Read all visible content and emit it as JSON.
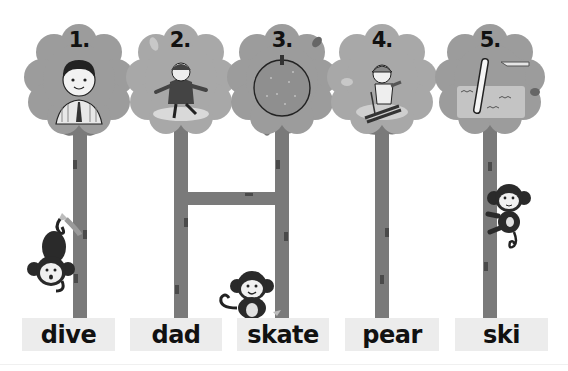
{
  "colors": {
    "crown": "#9c9c9c",
    "trunk": "#7a7a7a",
    "bark_mark": "#4a4a4a",
    "label_bg": "#ececec",
    "text": "#111111"
  },
  "trees": [
    {
      "number": "1.",
      "picture": "man-in-striped-shirt-and-tie",
      "label": "dive"
    },
    {
      "number": "2.",
      "picture": "girl-ice-skating",
      "label": "dad"
    },
    {
      "number": "3.",
      "picture": "pear-fruit",
      "label": "skate"
    },
    {
      "number": "4.",
      "picture": "boy-skiing",
      "label": "pear"
    },
    {
      "number": "5.",
      "picture": "person-diving-into-pool",
      "label": "ski"
    }
  ],
  "ladder_connection": {
    "from_tree": 2,
    "to_tree": 3
  },
  "monkeys": [
    {
      "position": "hanging-upside-down-tree-1"
    },
    {
      "position": "sitting-at-base-tree-3"
    },
    {
      "position": "climbing-tree-5"
    }
  ]
}
